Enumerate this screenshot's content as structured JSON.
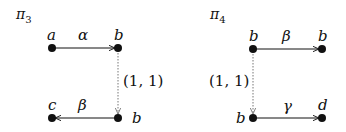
{
  "diagrams": [
    {
      "title": "π",
      "title_sub": "3",
      "nodes": [
        {
          "label": "a"
        },
        {
          "label": "b"
        },
        {
          "label": "c"
        },
        {
          "label": "b"
        }
      ],
      "edges": [
        {
          "label": "α"
        },
        {
          "label": "(1, 1)"
        },
        {
          "label": "β"
        }
      ]
    },
    {
      "title": "π",
      "title_sub": "4",
      "nodes": [
        {
          "label": "b"
        },
        {
          "label": "b"
        },
        {
          "label": "b"
        },
        {
          "label": "d"
        }
      ],
      "edges": [
        {
          "label": "β"
        },
        {
          "label": "(1, 1)"
        },
        {
          "label": "γ"
        }
      ]
    }
  ],
  "colors": {
    "ink": "#111111",
    "dotted": "#888888"
  }
}
